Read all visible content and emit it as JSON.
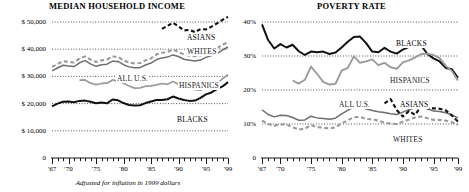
{
  "figure": {
    "footnote": "Adjusted for inflation in 1999 dollars"
  },
  "chart_data": [
    {
      "type": "line",
      "id": "median-household-income",
      "title": "MEDIAN HOUSEHOLD INCOME",
      "xlabel": "",
      "ylabel": "",
      "xlim": [
        1967,
        1999
      ],
      "ylim": [
        0,
        55000
      ],
      "grid": true,
      "grid_style": "dotted-horizontal",
      "legend": "inline-labels",
      "yticks": [
        0,
        10000,
        20000,
        30000,
        40000,
        50000
      ],
      "yticklabels": [
        "0",
        "$ 10,000",
        "$ 20,000",
        "$ 30,000",
        "$ 40,000",
        "$ 50,000"
      ],
      "xticks": [
        1967,
        1968,
        1969,
        1970,
        1971,
        1972,
        1973,
        1974,
        1975,
        1976,
        1977,
        1978,
        1979,
        1980,
        1981,
        1982,
        1983,
        1984,
        1985,
        1986,
        1987,
        1988,
        1989,
        1990,
        1991,
        1992,
        1993,
        1994,
        1995,
        1996,
        1997,
        1998,
        1999
      ],
      "xticklabels_shown": [
        "'67",
        "'70",
        "'75",
        "'80",
        "'85",
        "'90",
        "'95",
        "'99"
      ],
      "xticklabel_years": [
        1967,
        1970,
        1975,
        1980,
        1985,
        1990,
        1995,
        1999
      ],
      "series": [
        {
          "name": "ASIANS",
          "label": "ASIANS",
          "color": "#111111",
          "style": "dashed",
          "width": 2.1,
          "x": [
            1987,
            1988,
            1989,
            1990,
            1991,
            1992,
            1993,
            1994,
            1995,
            1996,
            1997,
            1998,
            1999
          ],
          "values": [
            47500,
            48600,
            49700,
            48400,
            46900,
            47100,
            46300,
            47400,
            47300,
            48300,
            49500,
            50800,
            51900
          ]
        },
        {
          "name": "WHITES",
          "label": "WHITES",
          "color": "#9a9a9a",
          "style": "dashed",
          "width": 2.1,
          "x": [
            1967,
            1968,
            1969,
            1970,
            1971,
            1972,
            1973,
            1974,
            1975,
            1976,
            1977,
            1978,
            1979,
            1980,
            1981,
            1982,
            1983,
            1984,
            1985,
            1986,
            1987,
            1988,
            1989,
            1990,
            1991,
            1992,
            1993,
            1994,
            1995,
            1996,
            1997,
            1998,
            1999
          ],
          "values": [
            33500,
            34500,
            35600,
            35300,
            35100,
            36600,
            37300,
            36200,
            35300,
            35900,
            36200,
            37300,
            37200,
            35900,
            35100,
            34800,
            34900,
            35900,
            36600,
            38100,
            38700,
            39000,
            39800,
            39000,
            38000,
            37600,
            37400,
            37700,
            38800,
            39400,
            40300,
            41700,
            42500
          ]
        },
        {
          "name": "ALL U.S.",
          "label": "ALL U.S.",
          "color": "#6e6e6e",
          "style": "solid",
          "width": 1.5,
          "x": [
            1967,
            1968,
            1969,
            1970,
            1971,
            1972,
            1973,
            1974,
            1975,
            1976,
            1977,
            1978,
            1979,
            1980,
            1981,
            1982,
            1983,
            1984,
            1985,
            1986,
            1987,
            1988,
            1989,
            1990,
            1991,
            1992,
            1993,
            1994,
            1995,
            1996,
            1997,
            1998,
            1999
          ],
          "values": [
            32000,
            33100,
            34100,
            33800,
            33600,
            35000,
            35800,
            34600,
            33700,
            34300,
            34500,
            35600,
            35500,
            34300,
            33500,
            33200,
            33200,
            34200,
            34900,
            36200,
            36800,
            37100,
            37900,
            37300,
            36300,
            35900,
            35700,
            36000,
            37000,
            37700,
            38400,
            39700,
            40800
          ]
        },
        {
          "name": "HISPANICS",
          "label": "HISPANICS",
          "color": "#9a9a9a",
          "style": "solid",
          "width": 1.7,
          "x": [
            1972,
            1973,
            1974,
            1975,
            1976,
            1977,
            1978,
            1979,
            1980,
            1981,
            1982,
            1983,
            1984,
            1985,
            1986,
            1987,
            1988,
            1989,
            1990,
            1991,
            1992,
            1993,
            1994,
            1995,
            1996,
            1997,
            1998,
            1999
          ],
          "values": [
            28600,
            28700,
            27500,
            27000,
            27400,
            27500,
            28700,
            28200,
            27500,
            26500,
            25700,
            25800,
            26400,
            26500,
            26900,
            27400,
            27100,
            28100,
            27100,
            26500,
            26000,
            25100,
            24900,
            25800,
            26400,
            27400,
            29100,
            30700
          ]
        },
        {
          "name": "BLACKS",
          "label": "BLACKS",
          "color": "#111111",
          "style": "solid",
          "width": 2.0,
          "x": [
            1967,
            1968,
            1969,
            1970,
            1971,
            1972,
            1973,
            1974,
            1975,
            1976,
            1977,
            1978,
            1979,
            1980,
            1981,
            1982,
            1983,
            1984,
            1985,
            1986,
            1987,
            1988,
            1989,
            1990,
            1991,
            1992,
            1993,
            1994,
            1995,
            1996,
            1997,
            1998,
            1999
          ],
          "values": [
            19000,
            20000,
            20700,
            20800,
            20500,
            21000,
            21100,
            20700,
            20100,
            20400,
            20100,
            21500,
            21200,
            20200,
            19500,
            19300,
            19400,
            20200,
            20800,
            21300,
            21300,
            21600,
            22600,
            21900,
            21300,
            21000,
            21100,
            22100,
            23400,
            24100,
            25300,
            26300,
            27900
          ]
        }
      ]
    },
    {
      "type": "line",
      "id": "poverty-rate",
      "title": "POVERTY RATE",
      "xlabel": "",
      "ylabel": "",
      "xlim": [
        1967,
        1999
      ],
      "ylim": [
        0,
        45
      ],
      "grid": true,
      "grid_style": "dotted-horizontal",
      "legend": "inline-labels",
      "yticks": [
        0,
        10,
        20,
        30,
        40
      ],
      "yticklabels": [
        "0",
        "10%",
        "20%",
        "30%",
        "40%"
      ],
      "xticks": [
        1967,
        1968,
        1969,
        1970,
        1971,
        1972,
        1973,
        1974,
        1975,
        1976,
        1977,
        1978,
        1979,
        1980,
        1981,
        1982,
        1983,
        1984,
        1985,
        1986,
        1987,
        1988,
        1989,
        1990,
        1991,
        1992,
        1993,
        1994,
        1995,
        1996,
        1997,
        1998,
        1999
      ],
      "xticklabels_shown": [
        "'67",
        "'70",
        "'75",
        "'80",
        "'85",
        "'90",
        "'95",
        "'99"
      ],
      "xticklabel_years": [
        1967,
        1970,
        1975,
        1980,
        1985,
        1990,
        1995,
        1999
      ],
      "series": [
        {
          "name": "BLACKS",
          "label": "BLACKS",
          "color": "#111111",
          "style": "solid",
          "width": 2.0,
          "x": [
            1967,
            1968,
            1969,
            1970,
            1971,
            1972,
            1973,
            1974,
            1975,
            1976,
            1977,
            1978,
            1979,
            1980,
            1981,
            1982,
            1983,
            1984,
            1985,
            1986,
            1987,
            1988,
            1989,
            1990,
            1991,
            1992,
            1993,
            1994,
            1995,
            1996,
            1997,
            1998,
            1999
          ],
          "values": [
            39.3,
            34.7,
            32.2,
            33.5,
            32.5,
            33.3,
            31.4,
            30.3,
            31.3,
            31.1,
            31.3,
            30.6,
            31.0,
            32.5,
            34.2,
            35.6,
            35.7,
            33.8,
            31.3,
            31.1,
            32.4,
            31.3,
            30.7,
            31.9,
            32.7,
            33.4,
            33.1,
            30.6,
            29.3,
            28.4,
            26.5,
            26.1,
            23.6
          ]
        },
        {
          "name": "HISPANICS",
          "label": "HISPANICS",
          "color": "#9a9a9a",
          "style": "solid",
          "width": 1.9,
          "x": [
            1972,
            1973,
            1974,
            1975,
            1976,
            1977,
            1978,
            1979,
            1980,
            1981,
            1982,
            1983,
            1984,
            1985,
            1986,
            1987,
            1988,
            1989,
            1990,
            1991,
            1992,
            1993,
            1994,
            1995,
            1996,
            1997,
            1998,
            1999
          ],
          "values": [
            22.8,
            21.9,
            23.0,
            26.9,
            24.7,
            22.4,
            21.6,
            21.8,
            25.7,
            26.5,
            29.9,
            28.0,
            28.4,
            29.0,
            27.3,
            28.0,
            26.7,
            26.2,
            28.1,
            28.7,
            29.6,
            30.6,
            30.7,
            30.3,
            29.4,
            27.1,
            25.6,
            22.8
          ]
        },
        {
          "name": "ALL U.S.",
          "label": "ALL U.S.",
          "color": "#6e6e6e",
          "style": "solid",
          "width": 1.5,
          "x": [
            1967,
            1968,
            1969,
            1970,
            1971,
            1972,
            1973,
            1974,
            1975,
            1976,
            1977,
            1978,
            1979,
            1980,
            1981,
            1982,
            1983,
            1984,
            1985,
            1986,
            1987,
            1988,
            1989,
            1990,
            1991,
            1992,
            1993,
            1994,
            1995,
            1996,
            1997,
            1998,
            1999
          ],
          "values": [
            14.2,
            12.8,
            12.1,
            12.6,
            12.5,
            11.9,
            11.1,
            11.2,
            12.3,
            11.8,
            11.6,
            11.4,
            11.7,
            13.0,
            14.0,
            15.0,
            15.2,
            14.4,
            14.0,
            13.6,
            13.4,
            13.0,
            12.8,
            13.5,
            14.2,
            14.8,
            15.1,
            14.5,
            13.8,
            13.7,
            13.3,
            12.7,
            11.8
          ]
        },
        {
          "name": "ASIANS",
          "label": "ASIANS",
          "color": "#111111",
          "style": "dashed",
          "width": 2.1,
          "x": [
            1987,
            1988,
            1989,
            1990,
            1991,
            1992,
            1993,
            1994,
            1995,
            1996,
            1997,
            1998,
            1999
          ],
          "values": [
            16.1,
            17.3,
            14.1,
            12.2,
            13.8,
            12.7,
            15.3,
            14.6,
            14.6,
            14.5,
            14.0,
            12.5,
            10.7
          ]
        },
        {
          "name": "WHITES",
          "label": "WHITES",
          "color": "#9a9a9a",
          "style": "dashed",
          "width": 2.1,
          "x": [
            1967,
            1968,
            1969,
            1970,
            1971,
            1972,
            1973,
            1974,
            1975,
            1976,
            1977,
            1978,
            1979,
            1980,
            1981,
            1982,
            1983,
            1984,
            1985,
            1986,
            1987,
            1988,
            1989,
            1990,
            1991,
            1992,
            1993,
            1994,
            1995,
            1996,
            1997,
            1998,
            1999
          ],
          "values": [
            11.0,
            10.0,
            9.5,
            9.9,
            9.9,
            9.0,
            8.4,
            8.6,
            9.7,
            9.1,
            8.9,
            8.7,
            9.0,
            10.2,
            11.1,
            12.0,
            12.1,
            11.5,
            11.4,
            11.0,
            10.4,
            10.1,
            10.0,
            10.7,
            11.3,
            11.9,
            12.2,
            11.7,
            11.2,
            11.2,
            11.0,
            10.5,
            9.8
          ]
        }
      ]
    }
  ]
}
